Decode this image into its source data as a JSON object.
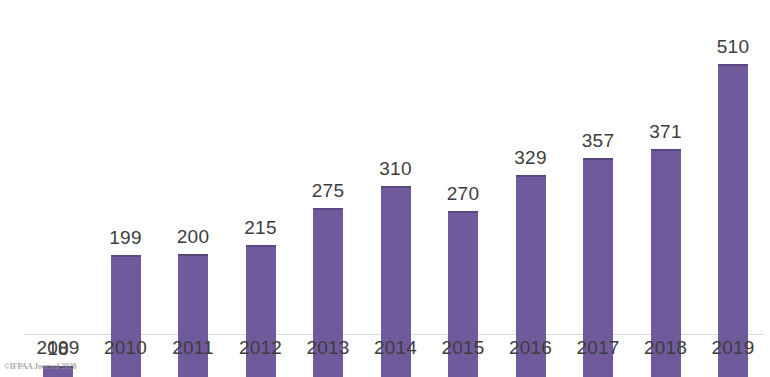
{
  "chart_data": {
    "type": "bar",
    "title": "",
    "subtitle": "",
    "xlabel": "",
    "ylabel": "",
    "categories": [
      "2009",
      "2010",
      "2011",
      "2012",
      "2013",
      "2014",
      "2015",
      "2016",
      "2017",
      "2018",
      "2019"
    ],
    "values": [
      18,
      199,
      200,
      215,
      275,
      310,
      270,
      329,
      357,
      371,
      510
    ],
    "value_labels": [
      "18",
      "199",
      "200",
      "215",
      "275",
      "310",
      "270",
      "329",
      "357",
      "371",
      "510"
    ],
    "series": [
      {
        "name": "",
        "values": [
          18,
          199,
          200,
          215,
          275,
          310,
          270,
          329,
          357,
          371,
          510
        ]
      }
    ],
    "ylim": [
      0,
      545
    ],
    "grid": false,
    "legend": null,
    "axis_line": true,
    "bar_color": "#6f5a9c",
    "bar_edge_color": "#5b4880",
    "label_color": "#3d3d3d",
    "background_color": "#ffffff"
  },
  "watermark": {
    "text": "©IFPAA Journal 2020"
  }
}
